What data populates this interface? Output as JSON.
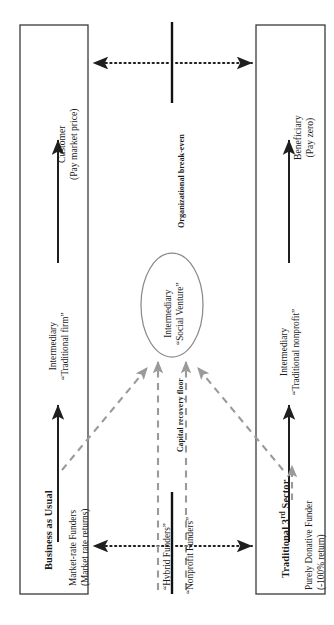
{
  "diagram": {
    "orientation": "rotated-90-ccw",
    "boxes": [
      {
        "id": "customer",
        "title": "",
        "line1": "Customer",
        "line2": "(Pay market price)"
      },
      {
        "id": "beneficiary",
        "title": "",
        "line1": "Beneficiary",
        "line2": "(Pay zero)"
      },
      {
        "id": "business",
        "title": "Business as Usual",
        "line1": "Market-rate Funders",
        "line2": "(Market rate returns)"
      },
      {
        "id": "third_sector",
        "title_pre": "Traditional 3",
        "title_sup": "rd",
        "title_post": " Sector",
        "line1": "Purely Donative Funder",
        "line2": "(-100% return)"
      }
    ],
    "center_node": {
      "line1": "Intermediary",
      "line2": "“Social Venture”"
    },
    "intermediary_left": {
      "line1": "Intermediary",
      "line2": "“Traditional firm”"
    },
    "intermediary_right": {
      "line1": "Intermediary",
      "line2": "“Traditional nonprofit”"
    },
    "axis_label": "Organizational break-even",
    "floor_label": "Capital recovery floor",
    "funder_labels": {
      "hybrid": "“Hybrid Funders”",
      "nonprofit": "“Nonprofit Funders”"
    },
    "colors": {
      "stroke": "#2b2b2b",
      "box_border": "#3a3a3a",
      "dashed": "#9a9a9a",
      "ellipse": "#8a8a8a",
      "background": "#ffffff"
    }
  }
}
